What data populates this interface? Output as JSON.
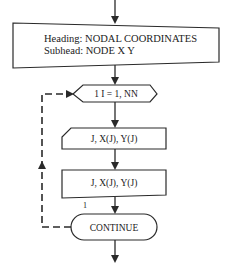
{
  "diagram": {
    "type": "flowchart",
    "nodes": {
      "header_output": {
        "shape": "display",
        "line1": "Heading: NODAL COORDINATES",
        "line2": "Subhead: NODE X Y"
      },
      "loop": {
        "shape": "loop-preparation",
        "label": "1  I = 1, NN"
      },
      "read_card": {
        "shape": "card-input",
        "label": "J, X(J), Y(J)"
      },
      "write_output": {
        "shape": "display",
        "label": "J, X(J), Y(J)"
      },
      "continue": {
        "shape": "terminator",
        "label": "CONTINUE"
      }
    },
    "statement_label": "1",
    "edges": [
      {
        "from": "entry",
        "to": "header_output",
        "style": "solid"
      },
      {
        "from": "header_output",
        "to": "loop",
        "style": "solid"
      },
      {
        "from": "loop",
        "to": "read_card",
        "style": "solid"
      },
      {
        "from": "read_card",
        "to": "write_output",
        "style": "solid"
      },
      {
        "from": "write_output",
        "to": "continue",
        "style": "solid"
      },
      {
        "from": "continue",
        "to": "loop",
        "style": "dashed"
      },
      {
        "from": "continue",
        "to": "exit",
        "style": "solid"
      }
    ]
  }
}
